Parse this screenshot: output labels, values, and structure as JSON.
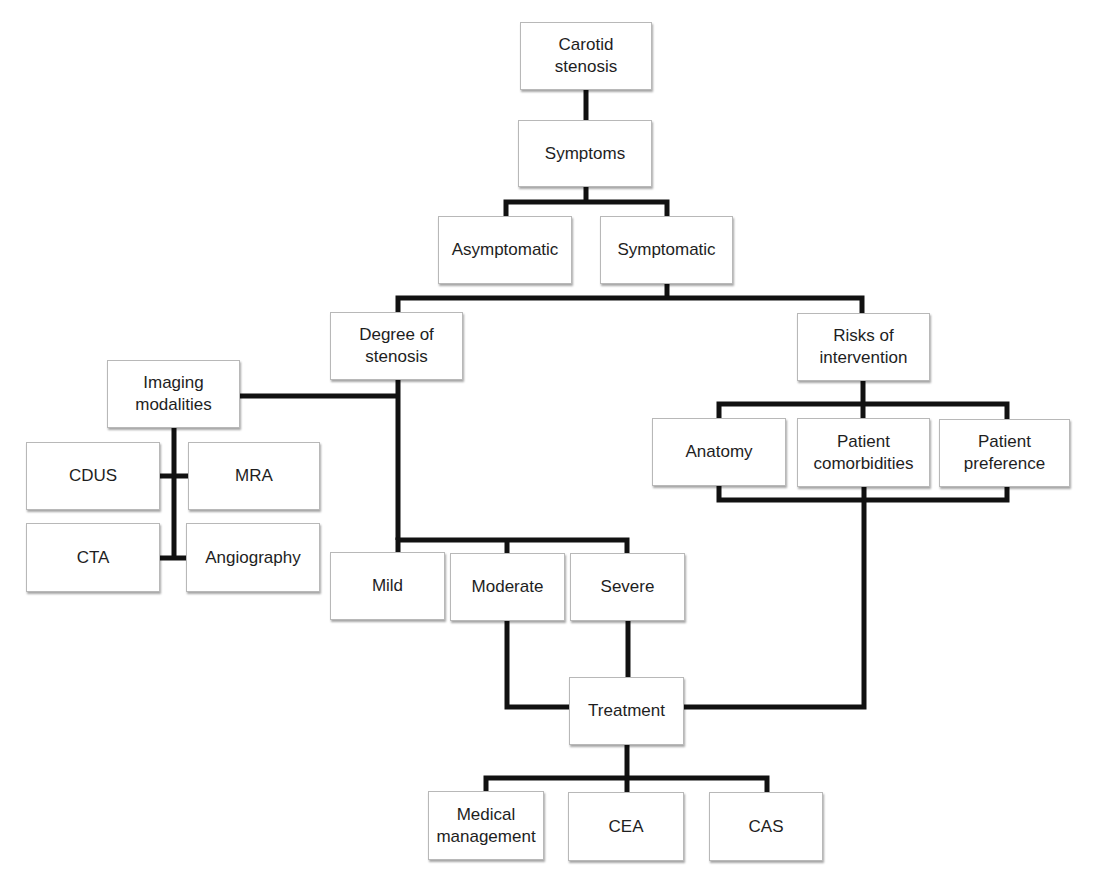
{
  "diagram": {
    "type": "flowchart",
    "line_color": "#111111",
    "box_border_color": "#b8b8b8",
    "nodes": {
      "carotid_stenosis": "Carotid\nstenosis",
      "symptoms": "Symptoms",
      "asymptomatic": "Asymptomatic",
      "symptomatic": "Symptomatic",
      "degree_of_stenosis": "Degree of\nstenosis",
      "risks_of_intervention": "Risks of\nintervention",
      "imaging_modalities": "Imaging\nmodalities",
      "cdus": "CDUS",
      "mra": "MRA",
      "cta": "CTA",
      "angiography": "Angiography",
      "anatomy": "Anatomy",
      "patient_comorbidities": "Patient\ncomorbidities",
      "patient_preference": "Patient\npreference",
      "mild": "Mild",
      "moderate": "Moderate",
      "severe": "Severe",
      "treatment": "Treatment",
      "medical_management": "Medical\nmanagement",
      "cea": "CEA",
      "cas": "CAS"
    },
    "edges": [
      [
        "Carotid stenosis",
        "Symptoms"
      ],
      [
        "Symptoms",
        "Asymptomatic"
      ],
      [
        "Symptoms",
        "Symptomatic"
      ],
      [
        "Symptomatic",
        "Degree of stenosis"
      ],
      [
        "Symptomatic",
        "Risks of intervention"
      ],
      [
        "Degree of stenosis",
        "Imaging modalities"
      ],
      [
        "Imaging modalities",
        "CDUS"
      ],
      [
        "Imaging modalities",
        "MRA"
      ],
      [
        "Imaging modalities",
        "CTA"
      ],
      [
        "Imaging modalities",
        "Angiography"
      ],
      [
        "Degree of stenosis",
        "Mild"
      ],
      [
        "Degree of stenosis",
        "Moderate"
      ],
      [
        "Degree of stenosis",
        "Severe"
      ],
      [
        "Risks of intervention",
        "Anatomy"
      ],
      [
        "Risks of intervention",
        "Patient comorbidities"
      ],
      [
        "Risks of intervention",
        "Patient preference"
      ],
      [
        "Moderate",
        "Treatment"
      ],
      [
        "Severe",
        "Treatment"
      ],
      [
        "Patient comorbidities",
        "Treatment"
      ],
      [
        "Treatment",
        "Medical management"
      ],
      [
        "Treatment",
        "CEA"
      ],
      [
        "Treatment",
        "CAS"
      ]
    ]
  }
}
